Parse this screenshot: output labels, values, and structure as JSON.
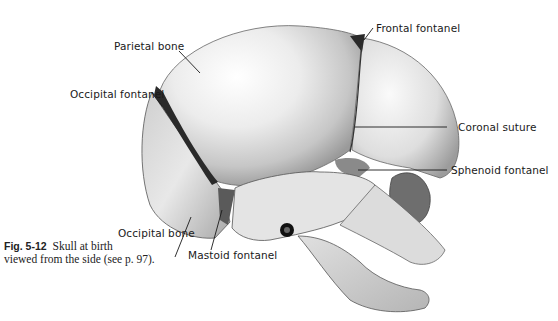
{
  "figure": {
    "number": "Fig. 5-12",
    "caption_line1": "Skull at birth",
    "caption_line2": "viewed from the side (see p. 97)."
  },
  "labels": {
    "parietal_bone": "Parietal bone",
    "occipital_fontanel": "Occipital fontanel",
    "frontal_fontanel": "Frontal fontanel",
    "coronal_suture": "Coronal suture",
    "sphenoid_fontanel": "Sphenoid fontanel",
    "occipital_bone": "Occipital bone",
    "mastoid_fontanel": "Mastoid fontanel"
  },
  "colors": {
    "background": "#ffffff",
    "bone_light": "#f2f2f2",
    "bone_mid": "#c8c8c8",
    "bone_dark": "#8a8a8a",
    "fontanel": "#2a2a2a",
    "leader_line": "#1a1a1a"
  }
}
